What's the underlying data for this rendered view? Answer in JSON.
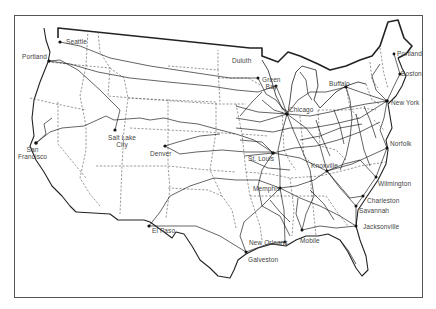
{
  "map": {
    "title": "Railroad network of the United States",
    "cities": [
      {
        "id": "seattle",
        "name": "Seattle",
        "x": 60,
        "y": 42,
        "lx": 66,
        "ly": 38
      },
      {
        "id": "portland-or",
        "name": "Portland",
        "x": 49,
        "y": 61,
        "lx": 22,
        "ly": 53
      },
      {
        "id": "san-francisco",
        "name": "San\nFrancisco",
        "x": 36,
        "y": 143,
        "lx": 19,
        "ly": 146
      },
      {
        "id": "salt-lake-city",
        "name": "Salt Lake\nCity",
        "x": 115,
        "y": 130,
        "lx": 110,
        "ly": 134
      },
      {
        "id": "denver",
        "name": "Denver",
        "x": 165,
        "y": 146,
        "lx": 150,
        "ly": 150
      },
      {
        "id": "el-paso",
        "name": "El Paso",
        "x": 149,
        "y": 226,
        "lx": 151,
        "ly": 227
      },
      {
        "id": "duluth",
        "name": "Duluth",
        "x": 258,
        "y": 78,
        "lx": 232,
        "ly": 57
      },
      {
        "id": "green-bay",
        "name": "Green\nBay",
        "x": 276,
        "y": 86,
        "lx": 264,
        "ly": 76
      },
      {
        "id": "chicago",
        "name": "Chicago",
        "x": 287,
        "y": 114,
        "lx": 290,
        "ly": 105
      },
      {
        "id": "buffalo",
        "name": "Buffalo",
        "x": 346,
        "y": 87,
        "lx": 329,
        "ly": 80
      },
      {
        "id": "portland-me",
        "name": "Portland",
        "x": 394,
        "y": 54,
        "lx": 397,
        "ly": 50
      },
      {
        "id": "boston",
        "name": "Boston",
        "x": 400,
        "y": 74,
        "lx": 401,
        "ly": 70
      },
      {
        "id": "new-york",
        "name": "New York",
        "x": 387,
        "y": 101,
        "lx": 391,
        "ly": 99
      },
      {
        "id": "st-louis",
        "name": "St. Louis",
        "x": 273,
        "y": 153,
        "lx": 248,
        "ly": 155
      },
      {
        "id": "knoxville",
        "name": "Knoxville",
        "x": 327,
        "y": 171,
        "lx": 312,
        "ly": 161
      },
      {
        "id": "norfolk",
        "name": "Norfolk",
        "x": 387,
        "y": 148,
        "lx": 390,
        "ly": 140
      },
      {
        "id": "memphis",
        "name": "Memphis",
        "x": 280,
        "y": 188,
        "lx": 254,
        "ly": 185
      },
      {
        "id": "wilmington",
        "name": "Wilmington",
        "x": 376,
        "y": 177,
        "lx": 378,
        "ly": 180
      },
      {
        "id": "charleston",
        "name": "Charleston",
        "x": 363,
        "y": 196,
        "lx": 367,
        "ly": 197
      },
      {
        "id": "savannah",
        "name": "Savannah",
        "x": 356,
        "y": 206,
        "lx": 359,
        "ly": 207
      },
      {
        "id": "jacksonville",
        "name": "Jacksonville",
        "x": 356,
        "y": 226,
        "lx": 363,
        "ly": 223
      },
      {
        "id": "new-orleans",
        "name": "New Orleans",
        "x": 285,
        "y": 242,
        "lx": 249,
        "ly": 239
      },
      {
        "id": "mobile",
        "name": "Mobile",
        "x": 302,
        "y": 230,
        "lx": 300,
        "ly": 237
      },
      {
        "id": "galveston",
        "name": "Galveston",
        "x": 246,
        "y": 252,
        "lx": 248,
        "ly": 255
      }
    ]
  }
}
